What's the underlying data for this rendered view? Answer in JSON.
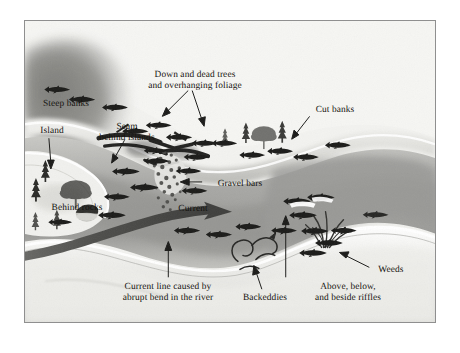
{
  "figure": {
    "border_color": "#8f8f8f",
    "paper_color": "#f2f2f0",
    "ink_color": "#15130f"
  },
  "labels": {
    "steep_banks": "Steep banks",
    "island": "Island",
    "seam_behind_islands": "Seam\nbehind islands",
    "behind_rocks": "Behind rocks",
    "down_and_dead_trees": "Down and dead trees\nand overhanging foliage",
    "gravel_bars": "Gravel bars",
    "current": "Current",
    "cut_banks": "Cut banks",
    "weeds": "Weeds",
    "current_line": "Current line caused by\nabrupt bend in the river",
    "backeddies": "Backeddies",
    "riffles": "Above, below,\nand beside riffles"
  },
  "icons": {
    "fish": "fish-icon",
    "conifer_tree": "conifer-tree-icon",
    "deciduous_tree": "deciduous-tree-icon",
    "weed_clump": "weed-clump-icon",
    "gravel_bar": "gravel-bar-icon",
    "deadfall_log": "deadfall-log-icon",
    "current_arrow": "current-arrow-icon",
    "back_eddy_swirl": "back-eddy-swirl-icon",
    "leader_arrow": "leader-arrow-icon"
  },
  "colors": {
    "water_dark": "#9d9d9b",
    "water_mid": "#b8b8b5",
    "water_light": "#d8d8d5",
    "bank_light": "#efefec",
    "hill_shadow": "#7e7e7c",
    "current_band": "#4a4a48",
    "fish_body": "#1b1b19"
  }
}
